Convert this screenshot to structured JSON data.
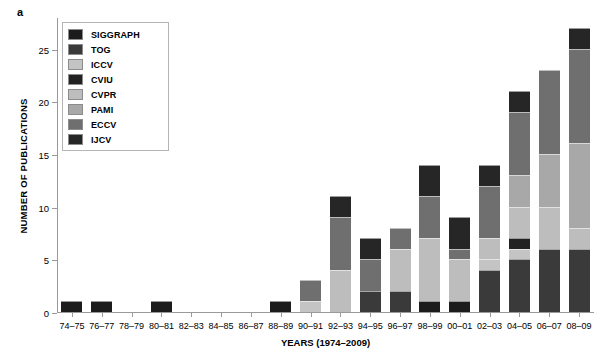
{
  "panel": {
    "label": "a"
  },
  "chart_data": {
    "type": "bar",
    "subtype": "stacked-bar",
    "title": "",
    "xlabel": "YEARS (1974–2009)",
    "ylabel": "NUMBER OF PUBLICATIONS",
    "ylim": [
      0,
      28
    ],
    "yticks": [
      0,
      5,
      10,
      15,
      20,
      25
    ],
    "grid": false,
    "legend_position": "upper-left",
    "categories": [
      "74–75",
      "76–77",
      "78–79",
      "80–81",
      "82–83",
      "84–85",
      "86–87",
      "88–89",
      "90–91",
      "92–93",
      "94–95",
      "96–97",
      "98–99",
      "00–01",
      "02–03",
      "04–05",
      "06–07",
      "08–09"
    ],
    "series": [
      {
        "name": "SIGGRAPH",
        "color": "#1c1c1c",
        "values": [
          1,
          1,
          0,
          1,
          0,
          0,
          0,
          1,
          0,
          0,
          0,
          0,
          1,
          1,
          0,
          0,
          0,
          0
        ]
      },
      {
        "name": "TOG",
        "color": "#3a3a3a",
        "values": [
          0,
          0,
          0,
          0,
          0,
          0,
          0,
          0,
          0,
          0,
          2,
          2,
          0,
          0,
          4,
          5,
          6,
          6
        ]
      },
      {
        "name": "ICCV",
        "color": "#c4c4c4",
        "values": [
          0,
          0,
          0,
          0,
          0,
          0,
          0,
          0,
          1,
          0,
          0,
          0,
          0,
          0,
          1,
          1,
          0,
          0
        ]
      },
      {
        "name": "CVIU",
        "color": "#222222",
        "values": [
          0,
          0,
          0,
          0,
          0,
          0,
          0,
          0,
          0,
          0,
          0,
          0,
          0,
          0,
          0,
          1,
          0,
          0
        ]
      },
      {
        "name": "CVPR",
        "color": "#bdbdbd",
        "values": [
          0,
          0,
          0,
          0,
          0,
          0,
          0,
          0,
          0,
          4,
          0,
          4,
          6,
          4,
          2,
          3,
          4,
          2
        ]
      },
      {
        "name": "PAMI",
        "color": "#a8a8a8",
        "values": [
          0,
          0,
          0,
          0,
          0,
          0,
          0,
          0,
          0,
          0,
          0,
          0,
          0,
          0,
          0,
          3,
          5,
          8
        ]
      },
      {
        "name": "ECCV",
        "color": "#6f6f6f",
        "values": [
          0,
          0,
          0,
          0,
          0,
          0,
          0,
          0,
          2,
          5,
          3,
          2,
          4,
          1,
          5,
          6,
          8,
          9
        ]
      },
      {
        "name": "IJCV",
        "color": "#262626",
        "values": [
          0,
          0,
          0,
          0,
          0,
          0,
          0,
          0,
          0,
          2,
          2,
          0,
          3,
          3,
          2,
          2,
          0,
          2
        ]
      }
    ],
    "totals": [
      1,
      1,
      0,
      1,
      0,
      0,
      0,
      1,
      3,
      11,
      7,
      8,
      14,
      9,
      14,
      21,
      23,
      27
    ]
  },
  "legend": {
    "items": [
      {
        "label": "SIGGRAPH",
        "color": "#1c1c1c"
      },
      {
        "label": "TOG",
        "color": "#3a3a3a"
      },
      {
        "label": "ICCV",
        "color": "#c4c4c4"
      },
      {
        "label": "CVIU",
        "color": "#222222"
      },
      {
        "label": "CVPR",
        "color": "#bdbdbd"
      },
      {
        "label": "PAMI",
        "color": "#a8a8a8"
      },
      {
        "label": "ECCV",
        "color": "#6f6f6f"
      },
      {
        "label": "IJCV",
        "color": "#262626"
      }
    ]
  }
}
